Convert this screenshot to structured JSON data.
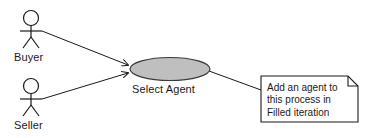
{
  "diagram": {
    "type": "uml-use-case-diagram",
    "width": 371,
    "height": 138,
    "background_color": "#ffffff",
    "stroke_color": "#1a1a1a",
    "text_color": "#1a1a1a"
  },
  "actors": [
    {
      "id": "buyer",
      "label": "Buyer",
      "head_center": {
        "x": 31,
        "y": 18
      },
      "head_radius": 7.5,
      "body": {
        "x1": 31,
        "y1": 25.5,
        "x2": 31,
        "y2": 37
      },
      "arms": {
        "x1": 20,
        "y1": 31,
        "x2": 42,
        "y2": 31
      },
      "leg_left": {
        "x1": 31,
        "y1": 37,
        "x2": 23,
        "y2": 48
      },
      "leg_right": {
        "x1": 31,
        "y1": 37,
        "x2": 39,
        "y2": 48
      }
    },
    {
      "id": "seller",
      "label": "Seller",
      "head_center": {
        "x": 31,
        "y": 86
      },
      "head_radius": 7.5,
      "body": {
        "x1": 31,
        "y1": 93.5,
        "x2": 31,
        "y2": 105
      },
      "arms": {
        "x1": 20,
        "y1": 99,
        "x2": 42,
        "y2": 99
      },
      "leg_left": {
        "x1": 31,
        "y1": 105,
        "x2": 23,
        "y2": 116
      },
      "leg_right": {
        "x1": 31,
        "y1": 105,
        "x2": 39,
        "y2": 116
      }
    }
  ],
  "use_cases": [
    {
      "id": "select-agent",
      "label": "Select Agent",
      "center": {
        "x": 170,
        "y": 69
      },
      "rx": 40,
      "ry": 11.5,
      "fill_color": "#bfbfbf",
      "stroke_color": "#3a3a3a"
    }
  ],
  "associations": [
    {
      "id": "buyer-to-select-agent",
      "from": "buyer",
      "to": "select-agent",
      "start": {
        "x": 42,
        "y": 31
      },
      "end": {
        "x": 131,
        "y": 66
      },
      "arrowhead": true
    },
    {
      "id": "seller-to-select-agent",
      "from": "seller",
      "to": "select-agent",
      "start": {
        "x": 42,
        "y": 99
      },
      "end": {
        "x": 131,
        "y": 72
      },
      "arrowhead": true
    }
  ],
  "note": {
    "id": "note-add-agent",
    "lines": [
      "Add an agent to",
      "this process in",
      "Filled iteration"
    ],
    "box": {
      "x": 261,
      "y": 76,
      "width": 97,
      "height": 46
    },
    "fold_size": 10,
    "fill_color": "#ffffff",
    "stroke_color": "#1a1a1a",
    "connector": {
      "start": {
        "x": 210,
        "y": 71
      },
      "end": {
        "x": 261,
        "y": 90
      }
    }
  }
}
